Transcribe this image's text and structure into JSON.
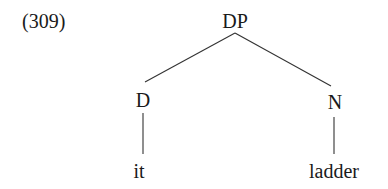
{
  "example_number": "(309)",
  "tree": {
    "root": {
      "label": "DP"
    },
    "children": [
      {
        "label": "D",
        "terminal": "it"
      },
      {
        "label": "N",
        "terminal": "ladder"
      }
    ]
  }
}
